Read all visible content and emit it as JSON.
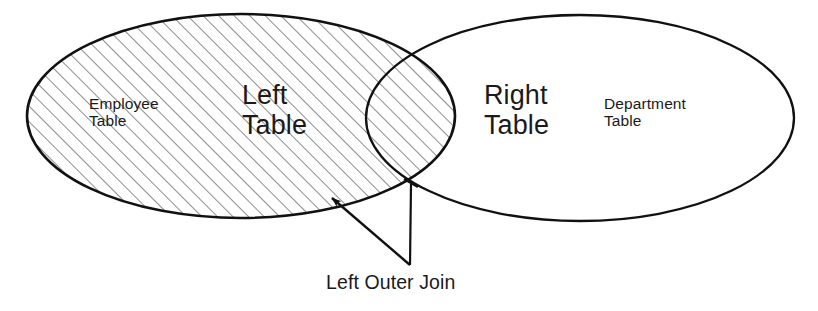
{
  "diagram": {
    "type": "venn-two-set",
    "canvas": {
      "width": 818,
      "height": 311
    },
    "colors": {
      "stroke": "#111111",
      "hatch": "#3a3a3a",
      "background": "#ffffff",
      "text": "#1a1a1a"
    },
    "sets": {
      "left": {
        "name": "left-set",
        "primary_label": "Left\nTable",
        "secondary_label": "Employee\nTable",
        "fill": "hatched",
        "center_x": 241,
        "center_y": 116,
        "radius_x": 214,
        "radius_y": 102
      },
      "right": {
        "name": "right-set",
        "primary_label": "Right\nTable",
        "secondary_label": "Department\nTable",
        "fill": "white",
        "center_x": 580,
        "center_y": 118,
        "radius_x": 214,
        "radius_y": 103
      }
    },
    "intersection": {
      "name": "overlap-lens",
      "fill": "hatched",
      "left_bound_x": 366,
      "right_bound_x": 455,
      "top_point": {
        "x": 410,
        "y": 63
      },
      "bottom_point": {
        "x": 411,
        "y": 182
      }
    },
    "annotation": {
      "caption": "Left Outer Join",
      "vertex": {
        "x": 410,
        "y": 265
      },
      "arrow_targets": [
        {
          "name": "arrow-to-left-only-region",
          "x": 330,
          "y": 196
        },
        {
          "name": "arrow-to-intersection-point",
          "x": 411,
          "y": 183
        }
      ]
    },
    "hatch": {
      "angle_degrees": 45,
      "spacing_px": 11,
      "line_width_px": 1.1
    }
  }
}
